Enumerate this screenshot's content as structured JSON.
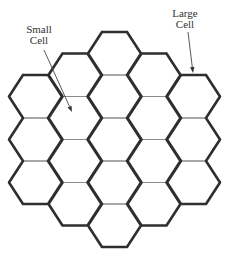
{
  "diagram": {
    "title": "",
    "labels": {
      "small_cell": {
        "line1": "Small",
        "line2": "Cell"
      },
      "large_cell": {
        "line1": "Large",
        "line2": "Cell"
      }
    },
    "grid": {
      "type": "hexagonal-flat-top",
      "hex_count": 19,
      "rings": 2,
      "center": [
        114.5,
        139.5
      ],
      "half_width": 26.5,
      "half_top": 12.5,
      "hex_height": 43,
      "column_step": 39.5,
      "columns": [
        {
          "k": -2,
          "count": 3
        },
        {
          "k": -1,
          "count": 4
        },
        {
          "k": 0,
          "count": 5
        },
        {
          "k": 1,
          "count": 4
        },
        {
          "k": 2,
          "count": 3
        }
      ]
    },
    "arrows": {
      "small_cell": {
        "from": [
          44,
          50
        ],
        "to": [
          72,
          112
        ]
      },
      "large_cell": {
        "from": [
          188,
          32
        ],
        "to": [
          193,
          73
        ]
      }
    },
    "colors": {
      "inner_edge": "#8a8a8a",
      "outer_edge": "#2e2e2e",
      "text": "#333333"
    }
  }
}
